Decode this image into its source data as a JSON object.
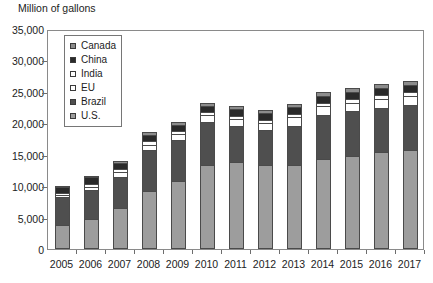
{
  "chart_data": {
    "type": "bar",
    "stacked": true,
    "title": "Million of gallons",
    "xlabel": "",
    "ylabel": "Million of gallons",
    "ylim": [
      0,
      35000
    ],
    "ytick_step": 5000,
    "grid": false,
    "legend_position": "upper-left-inside",
    "categories": [
      "2005",
      "2006",
      "2007",
      "2008",
      "2009",
      "2010",
      "2011",
      "2012",
      "2013",
      "2014",
      "2015",
      "2016",
      "2017"
    ],
    "ytick_labels": [
      "0",
      "5,000",
      "10,000",
      "15,000",
      "20,000",
      "25,000",
      "30,000",
      "35,000"
    ],
    "series": [
      {
        "name": "U.S.",
        "color": "#9d9d9d",
        "values": [
          3900,
          4850,
          6500,
          9300,
          10750,
          13300,
          13900,
          13300,
          13300,
          14300,
          14800,
          15400,
          15800
        ]
      },
      {
        "name": "Brazil",
        "color": "#4f4f4f",
        "values": [
          4400,
          4500,
          5000,
          6500,
          6600,
          6900,
          5600,
          5600,
          6300,
          7000,
          7100,
          7100,
          7100
        ]
      },
      {
        "name": "EU",
        "color": "#ffffff",
        "values": [
          250,
          570,
          750,
          800,
          1000,
          1150,
          1150,
          1150,
          1350,
          1400,
          1400,
          1400,
          1400
        ]
      },
      {
        "name": "India",
        "color": "#ffffff",
        "values": [
          300,
          500,
          500,
          550,
          350,
          450,
          550,
          550,
          550,
          600,
          600,
          600,
          700
        ]
      },
      {
        "name": "China",
        "color": "#2a2a2a",
        "values": [
          950,
          1000,
          1000,
          1000,
          1000,
          1000,
          1000,
          1000,
          1050,
          1100,
          1100,
          1150,
          1150
        ]
      },
      {
        "name": "Canada",
        "color": "#8c8c8c",
        "values": [
          150,
          250,
          300,
          400,
          450,
          450,
          500,
          500,
          550,
          600,
          600,
          600,
          600
        ]
      }
    ],
    "totals": [
      9950,
      11670,
      14050,
      18550,
      20150,
      23250,
      22700,
      22100,
      23100,
      24990,
      25600,
      26250,
      26750
    ]
  },
  "legend": {
    "items": [
      {
        "label": "Canada",
        "swatch": "#8c8c8c"
      },
      {
        "label": "China",
        "swatch": "#2a2a2a"
      },
      {
        "label": "India",
        "swatch": "#ffffff"
      },
      {
        "label": "EU",
        "swatch": "#ffffff"
      },
      {
        "label": "Brazil",
        "swatch": "#4f4f4f"
      },
      {
        "label": "U.S.",
        "swatch": "#9d9d9d"
      }
    ]
  },
  "axis": {
    "title": "Million of gallons"
  }
}
